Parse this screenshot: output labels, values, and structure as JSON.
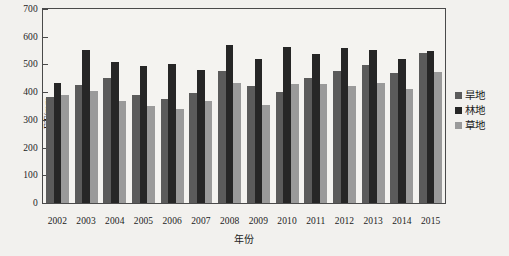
{
  "chart_data": {
    "type": "bar",
    "title": "",
    "subtitle": "",
    "xlabel": "年份",
    "ylabel": "ET/mm",
    "ylim": [
      0,
      700
    ],
    "ytick_step": 100,
    "yticks": [
      "0",
      "100",
      "200",
      "300",
      "400",
      "500",
      "600",
      "700"
    ],
    "grid": false,
    "legend_position": "right",
    "categories": [
      "2002",
      "2003",
      "2004",
      "2005",
      "2006",
      "2007",
      "2008",
      "2009",
      "2010",
      "2011",
      "2012",
      "2013",
      "2014",
      "2015"
    ],
    "series": [
      {
        "name": "旱地",
        "color": "#5b5b5b",
        "values": [
          383,
          425,
          452,
          388,
          375,
          396,
          475,
          422,
          400,
          452,
          478,
          498,
          470,
          542
        ]
      },
      {
        "name": "林地",
        "color": "#262626",
        "values": [
          433,
          553,
          510,
          495,
          500,
          481,
          570,
          518,
          562,
          538,
          558,
          553,
          520,
          548
        ]
      },
      {
        "name": "草地",
        "color": "#9a9a9a",
        "values": [
          388,
          405,
          368,
          350,
          341,
          368,
          432,
          352,
          430,
          428,
          422,
          432,
          413,
          472
        ]
      }
    ]
  },
  "legend": {
    "items": [
      {
        "label": "旱地",
        "color": "#5b5b5b"
      },
      {
        "label": "林地",
        "color": "#262626"
      },
      {
        "label": "草地",
        "color": "#9a9a9a"
      }
    ]
  }
}
